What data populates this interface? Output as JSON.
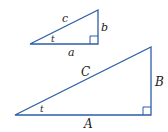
{
  "colors": {
    "line": "#2b5ea8",
    "text": "#222222"
  },
  "small_triangle": {
    "hypotenuse_label": "c",
    "vertical_label": "b",
    "horizontal_label": "a",
    "angle_label": "t"
  },
  "large_triangle": {
    "hypotenuse_label": "C",
    "vertical_label": "B",
    "horizontal_label": "A",
    "angle_label": "t"
  }
}
